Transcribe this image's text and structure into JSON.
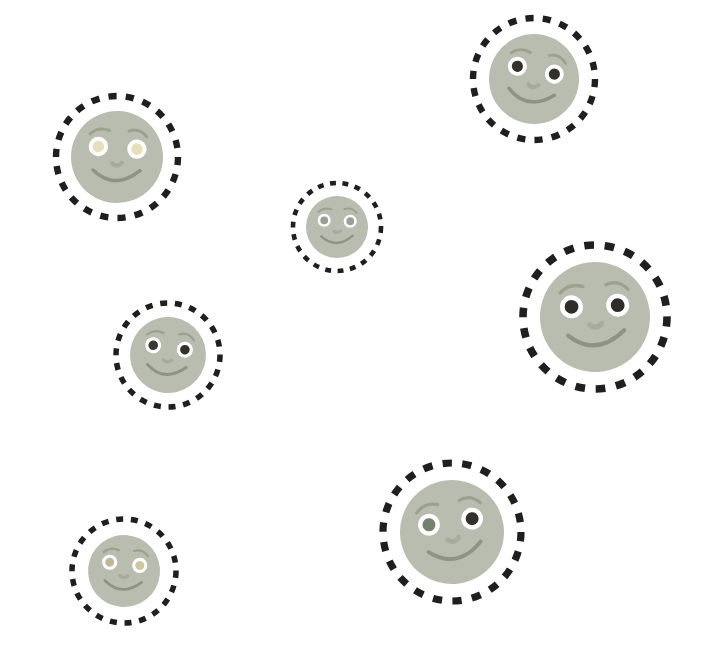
{
  "page": {
    "width": 716,
    "height": 654,
    "background": "#ffffff"
  },
  "illustration": {
    "description": "Seven cartoon smiling moon faces scattered on a white background, each enclosed by a black dashed circle",
    "face_count": 7,
    "colors": {
      "face_fill": "#b8bdb0",
      "ring_stroke": "#1f1f1d",
      "eye_white": "#ffffff",
      "smile_stroke": "#8e9383",
      "brow_stroke": "#9ba18f",
      "nose_stroke": "#a6ab9b"
    },
    "faces": [
      {
        "id": "top-right",
        "cx": 534,
        "cy": 79,
        "ring_r": 61,
        "face_r": 45,
        "tilt": 12,
        "pupil_left": "#34312b",
        "pupil_right": "#34312b"
      },
      {
        "id": "top-left",
        "cx": 117,
        "cy": 157,
        "ring_r": 61,
        "face_r": 46,
        "tilt": 4,
        "pupil_left": "#e6e0ba",
        "pupil_right": "#e6e0ba"
      },
      {
        "id": "center",
        "cx": 337,
        "cy": 227,
        "ring_r": 44,
        "face_r": 31,
        "tilt": 2,
        "pupil_left": "#99a195",
        "pupil_right": "#99a195"
      },
      {
        "id": "middle-right",
        "cx": 595,
        "cy": 317,
        "ring_r": 72,
        "face_r": 55,
        "tilt": -2,
        "pupil_left": "#2f2d28",
        "pupil_right": "#2f2d28"
      },
      {
        "id": "middle-left",
        "cx": 168,
        "cy": 355,
        "ring_r": 52,
        "face_r": 38,
        "tilt": 8,
        "pupil_left": "#3a3832",
        "pupil_right": "#34312b"
      },
      {
        "id": "bottom-right",
        "cx": 452,
        "cy": 532,
        "ring_r": 69,
        "face_r": 52,
        "tilt": -8,
        "pupil_left": "#75816f",
        "pupil_right": "#33302b"
      },
      {
        "id": "bottom-left",
        "cx": 124,
        "cy": 571,
        "ring_r": 52,
        "face_r": 36,
        "tilt": 6,
        "pupil_left": "#bcb898",
        "pupil_right": "#cfc7a0"
      }
    ]
  }
}
